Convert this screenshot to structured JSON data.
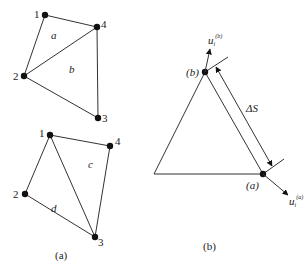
{
  "figure_a": {
    "caption": "(a)",
    "top_mesh": {
      "nodes": [
        {
          "id": "1",
          "x": 45,
          "y": 15
        },
        {
          "id": "4",
          "x": 97,
          "y": 27
        },
        {
          "id": "2",
          "x": 24,
          "y": 76
        },
        {
          "id": "3",
          "x": 98,
          "y": 118
        }
      ],
      "elements": [
        {
          "label": "a",
          "nodes": [
            "1",
            "2",
            "4"
          ]
        },
        {
          "label": "b",
          "nodes": [
            "2",
            "3",
            "4"
          ]
        }
      ]
    },
    "bottom_mesh": {
      "nodes": [
        {
          "id": "1",
          "x": 50,
          "y": 135
        },
        {
          "id": "4",
          "x": 110,
          "y": 146
        },
        {
          "id": "2",
          "x": 25,
          "y": 194
        },
        {
          "id": "3",
          "x": 95,
          "y": 237
        }
      ],
      "elements": [
        {
          "label": "c",
          "nodes": [
            "1",
            "3",
            "4"
          ]
        },
        {
          "label": "d",
          "nodes": [
            "1",
            "2",
            "3"
          ]
        }
      ]
    }
  },
  "figure_b": {
    "caption": "(b)",
    "point_b_label": "(b)",
    "point_a_label": "(a)",
    "distance_label": "ΔS",
    "vector_top": {
      "base": "u",
      "sub": "i",
      "sup": "(b)"
    },
    "vector_bottom": {
      "base": "u",
      "sub": "i",
      "sup": "(a)"
    }
  }
}
